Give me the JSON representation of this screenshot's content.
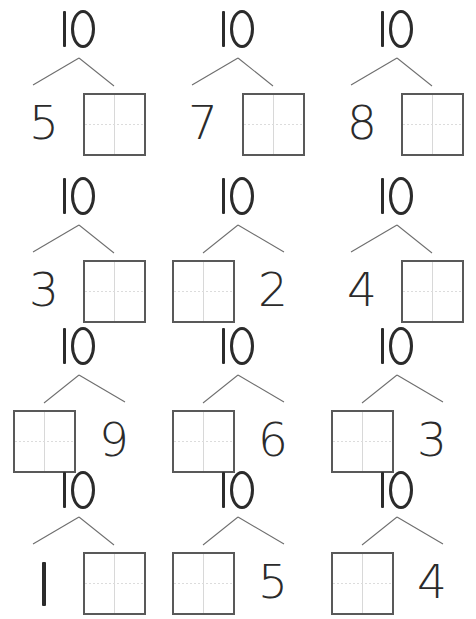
{
  "worksheet": {
    "title": "Number Bonds to 10",
    "whole_value": "10",
    "box_placeholder": "",
    "colors": {
      "background": "#ffffff",
      "ink": "#2b2b2b",
      "connector_line": "#6e6e6e",
      "box_border": "#595959",
      "box_guide": "#d8d8d8"
    },
    "rows": [
      {
        "cells": [
          {
            "whole": "10",
            "left_type": "number",
            "left_value": "5",
            "right_type": "box",
            "right_value": ""
          },
          {
            "whole": "10",
            "left_type": "number",
            "left_value": "7",
            "right_type": "box",
            "right_value": ""
          },
          {
            "whole": "10",
            "left_type": "number",
            "left_value": "8",
            "right_type": "box",
            "right_value": ""
          }
        ]
      },
      {
        "cells": [
          {
            "whole": "10",
            "left_type": "number",
            "left_value": "3",
            "right_type": "box",
            "right_value": ""
          },
          {
            "whole": "10",
            "left_type": "box",
            "left_value": "",
            "right_type": "number",
            "right_value": "2"
          },
          {
            "whole": "10",
            "left_type": "number",
            "left_value": "4",
            "right_type": "box",
            "right_value": ""
          }
        ]
      },
      {
        "cells": [
          {
            "whole": "10",
            "left_type": "box",
            "left_value": "",
            "right_type": "number",
            "right_value": "9"
          },
          {
            "whole": "10",
            "left_type": "box",
            "left_value": "",
            "right_type": "number",
            "right_value": "6"
          },
          {
            "whole": "10",
            "left_type": "box",
            "left_value": "",
            "right_type": "number",
            "right_value": "3"
          }
        ]
      },
      {
        "cells": [
          {
            "whole": "10",
            "left_type": "number",
            "left_value": "1",
            "right_type": "box",
            "right_value": ""
          },
          {
            "whole": "10",
            "left_type": "box",
            "left_value": "",
            "right_type": "number",
            "right_value": "5"
          },
          {
            "whole": "10",
            "left_type": "box",
            "left_value": "",
            "right_type": "number",
            "right_value": "4"
          }
        ]
      }
    ]
  }
}
